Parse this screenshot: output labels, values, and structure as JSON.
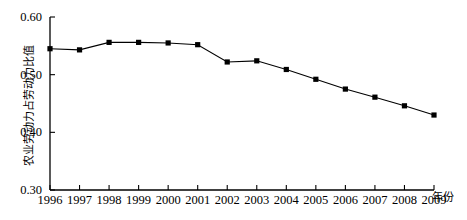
{
  "chart_data": {
    "type": "line",
    "title": "",
    "xlabel": "年份",
    "ylabel": "农业劳动力占劳动力比值",
    "categories": [
      "1996",
      "1997",
      "1998",
      "1999",
      "2000",
      "2001",
      "2002",
      "2003",
      "2004",
      "2005",
      "2006",
      "2007",
      "2008",
      "2009"
    ],
    "values": [
      0.545,
      0.543,
      0.556,
      0.556,
      0.555,
      0.552,
      0.522,
      0.524,
      0.509,
      0.492,
      0.475,
      0.461,
      0.446,
      0.43
    ],
    "series": [
      {
        "name": "农业劳动力占劳动力比值",
        "values": [
          0.545,
          0.543,
          0.556,
          0.556,
          0.555,
          0.552,
          0.522,
          0.524,
          0.509,
          0.492,
          0.475,
          0.461,
          0.446,
          0.43
        ]
      }
    ],
    "ylim": [
      0.3,
      0.6
    ],
    "ytick_labels": [
      "0.60",
      "0.50",
      "0.40",
      "0.30"
    ],
    "ytick_values": [
      0.6,
      0.5,
      0.4,
      0.3
    ],
    "xtick_labels": [
      "1996",
      "1997",
      "1998",
      "1999",
      "2000",
      "2001",
      "2002",
      "2003",
      "2004",
      "2005",
      "2006",
      "2007",
      "2008",
      "2009"
    ],
    "grid": false,
    "legend": "none",
    "marker": "square",
    "line_color": "#000000",
    "marker_color": "#000000",
    "axis_color": "#000000",
    "background_color": "#ffffff"
  },
  "axes": {
    "y_axis_label": "农业劳动力占劳动力比值",
    "x_axis_label": "年份",
    "y_ticks": [
      {
        "label": "0.60",
        "value": 0.6
      },
      {
        "label": "0.50",
        "value": 0.5
      },
      {
        "label": "0.40",
        "value": 0.4
      },
      {
        "label": "0.30",
        "value": 0.3
      }
    ],
    "x_ticks": [
      {
        "label": "1996"
      },
      {
        "label": "1997"
      },
      {
        "label": "1998"
      },
      {
        "label": "1999"
      },
      {
        "label": "2000"
      },
      {
        "label": "2001"
      },
      {
        "label": "2002"
      },
      {
        "label": "2003"
      },
      {
        "label": "2004"
      },
      {
        "label": "2005"
      },
      {
        "label": "2006"
      },
      {
        "label": "2007"
      },
      {
        "label": "2008"
      },
      {
        "label": "2009"
      }
    ]
  }
}
